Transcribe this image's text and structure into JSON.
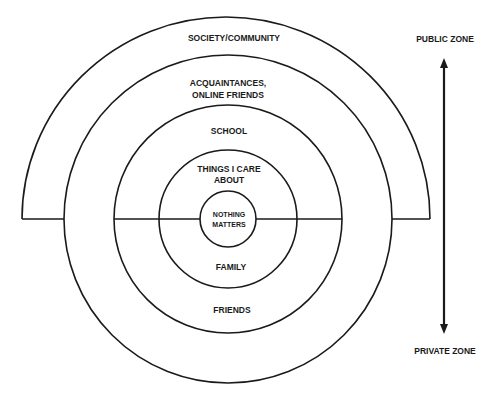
{
  "diagram": {
    "rings": [
      {
        "id": "society",
        "label": "SOCIETY/COMMUNITY",
        "shape": "upper-semicircle"
      },
      {
        "id": "acquaintances",
        "label_line1": "ACQUAINTANCES,",
        "label_line2": "ONLINE FRIENDS",
        "lower_label": "FRIENDS"
      },
      {
        "id": "school",
        "label": "SCHOOL",
        "lower_label": "FAMILY"
      },
      {
        "id": "care",
        "label_line1": "THINGS I CARE",
        "label_line2": "ABOUT"
      },
      {
        "id": "core",
        "label_line1": "NOTHING",
        "label_line2": "MATTERS"
      }
    ],
    "axis": {
      "top_label": "PUBLIC ZONE",
      "bottom_label": "PRIVATE ZONE",
      "direction": "bidirectional"
    },
    "colors": {
      "stroke": "#1a1a1a",
      "background": "#ffffff"
    }
  }
}
